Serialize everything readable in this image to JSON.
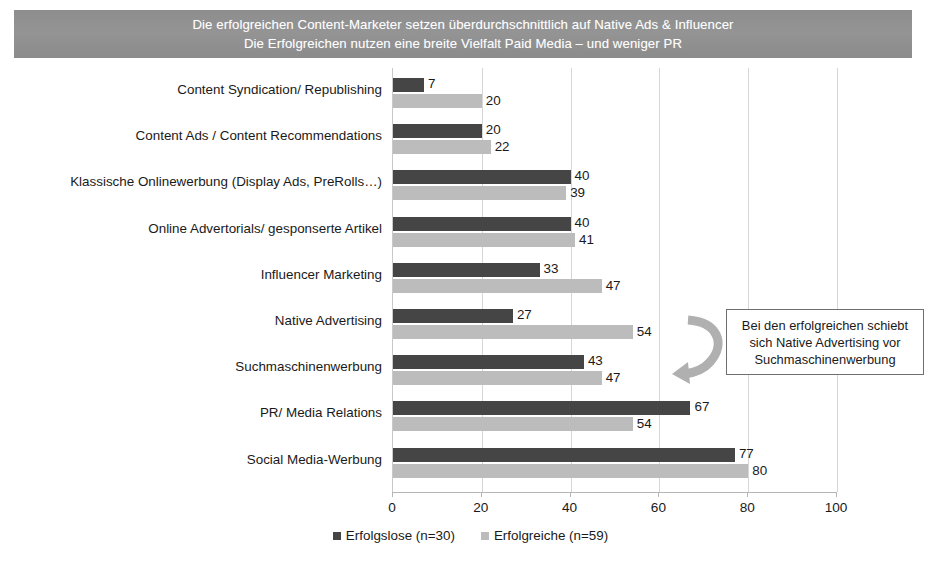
{
  "title": {
    "line1": "Die erfolgreichen Content-Marketer setzen überdurchschnittlich auf Native Ads & Influencer",
    "line2": "Die Erfolgreichen nutzen eine breite Vielfalt Paid Media – und weniger PR"
  },
  "callout": {
    "line1": "Bei den erfolgreichen schiebt",
    "line2": "sich Native Advertising vor",
    "line3": "Suchmaschinenwerbung"
  },
  "colors": {
    "series_dark": "#454545",
    "series_light": "#bcbcbc",
    "banner": "#8e8e8e",
    "gridline": "#d6d6d6",
    "text": "#1a1a1a"
  },
  "chart_data": {
    "type": "bar",
    "orientation": "horizontal",
    "title": "Die erfolgreichen Content-Marketer setzen überdurchschnittlich auf Native Ads & Influencer",
    "subtitle": "Die Erfolgreichen nutzen eine breite Vielfalt Paid Media – und weniger PR",
    "xlabel": "",
    "ylabel": "",
    "xlim": [
      0,
      100
    ],
    "xticks": [
      0,
      20,
      40,
      60,
      80,
      100
    ],
    "grid": true,
    "legend_position": "bottom",
    "categories": [
      "Content Syndication/ Republishing",
      "Content Ads / Content Recommendations",
      "Klassische Onlinewerbung (Display Ads, PreRolls…)",
      "Online Advertorials/ gesponserte Artikel",
      "Influencer Marketing",
      "Native Advertising",
      "Suchmaschinenwerbung",
      "PR/ Media Relations",
      "Social Media-Werbung"
    ],
    "series": [
      {
        "name": "Erfolgslose (n=30)",
        "color": "#454545",
        "values": [
          7,
          20,
          40,
          40,
          33,
          27,
          43,
          67,
          77
        ]
      },
      {
        "name": "Erfolgreiche (n=59)",
        "color": "#bcbcbc",
        "values": [
          20,
          22,
          39,
          41,
          47,
          54,
          47,
          54,
          80
        ]
      }
    ]
  }
}
